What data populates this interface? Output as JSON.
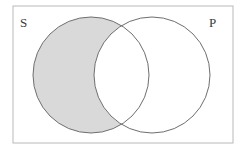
{
  "figure": {
    "type": "venn-diagram",
    "width": 241,
    "height": 156,
    "background_color": "#ffffff",
    "frame": {
      "name": "universe-rectangle",
      "x": 13,
      "y": 6,
      "width": 220,
      "height": 137,
      "stroke_color": "#b9b9b9",
      "stroke_width": 1,
      "fill": "none"
    },
    "circles": [
      {
        "name": "circle-s",
        "label": "S",
        "cx": 91,
        "cy": 75,
        "r": 58,
        "stroke_color": "#6e6e6e",
        "stroke_width": 1,
        "fill": "none"
      },
      {
        "name": "circle-p",
        "label": "P",
        "cx": 152,
        "cy": 75,
        "r": 58,
        "stroke_color": "#6e6e6e",
        "stroke_width": 1,
        "fill": "none"
      }
    ],
    "shaded_region": {
      "name": "s-minus-p-region",
      "region": "S only (S minus P)",
      "fill_color": "#d9d9d9",
      "shaded": true
    },
    "unshaded_regions": [
      {
        "name": "s-and-p-region",
        "region": "S intersect P",
        "fill_color": "#ffffff"
      },
      {
        "name": "p-minus-s-region",
        "region": "P only (P minus S)",
        "fill_color": "#ffffff"
      }
    ],
    "labels": [
      {
        "name": "label-s",
        "text": "S",
        "x": 20,
        "y": 27,
        "color": "#3a3a3a"
      },
      {
        "name": "label-p",
        "text": "P",
        "x": 209,
        "y": 27,
        "color": "#3a3a3a"
      }
    ]
  }
}
